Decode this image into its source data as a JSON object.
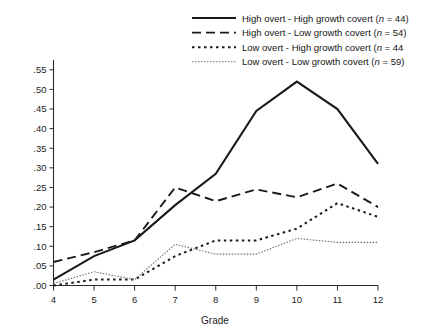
{
  "chart_data": {
    "type": "line",
    "title": "",
    "xlabel": "Grade",
    "ylabel": "",
    "x": [
      4,
      5,
      6,
      7,
      8,
      9,
      10,
      11,
      12
    ],
    "categories": [
      "4",
      "5",
      "6",
      "7",
      "8",
      "9",
      "10",
      "11",
      "12"
    ],
    "xlim": [
      4,
      12
    ],
    "ylim": [
      0.0,
      0.575
    ],
    "ytick_labels": [
      ".00",
      ".05",
      ".10",
      ".15",
      ".20",
      ".25",
      ".30",
      ".35",
      ".40",
      ".45",
      ".50",
      ".55"
    ],
    "ytick_values": [
      0.0,
      0.05,
      0.1,
      0.15,
      0.2,
      0.25,
      0.3,
      0.35,
      0.4,
      0.45,
      0.5,
      0.55
    ],
    "grid": false,
    "legend_position": "top-right",
    "series": [
      {
        "name": "High overt - High growth covert (n = 44)",
        "label_main": "High overt - High growth covert (",
        "label_italic": "n",
        "label_tail": " = 44)",
        "style": "solid",
        "color": "#1a1a1a",
        "width": 2.1,
        "dash": "",
        "values": [
          0.015,
          0.075,
          0.115,
          0.205,
          0.285,
          0.445,
          0.52,
          0.45,
          0.31
        ]
      },
      {
        "name": "High overt - Low growth covert (n = 54)",
        "label_main": "High overt - Low growth covert (",
        "label_italic": "n",
        "label_tail": " = 54)",
        "style": "dashed",
        "color": "#1a1a1a",
        "width": 1.9,
        "dash": "9,5",
        "values": [
          0.06,
          0.085,
          0.115,
          0.25,
          0.215,
          0.245,
          0.225,
          0.26,
          0.2
        ]
      },
      {
        "name": "Low overt - High growth covert (n = 44",
        "label_main": "Low overt - High growth covert (",
        "label_italic": "n",
        "label_tail": " = 44",
        "style": "dotted-bold",
        "color": "#1a1a1a",
        "width": 2.0,
        "dash": "2.5,3.5",
        "values": [
          0.0,
          0.015,
          0.015,
          0.075,
          0.115,
          0.115,
          0.145,
          0.21,
          0.175
        ]
      },
      {
        "name": "Low overt - Low growth covert (n = 59)",
        "label_main": "Low overt - Low growth covert (",
        "label_italic": "n",
        "label_tail": " = 59)",
        "style": "dotted-fine",
        "color": "#6e6e6e",
        "width": 1.1,
        "dash": "1.5,1.5",
        "values": [
          0.005,
          0.035,
          0.015,
          0.105,
          0.08,
          0.08,
          0.12,
          0.11,
          0.11
        ]
      }
    ]
  },
  "axes": {
    "x_title": "Grade"
  }
}
